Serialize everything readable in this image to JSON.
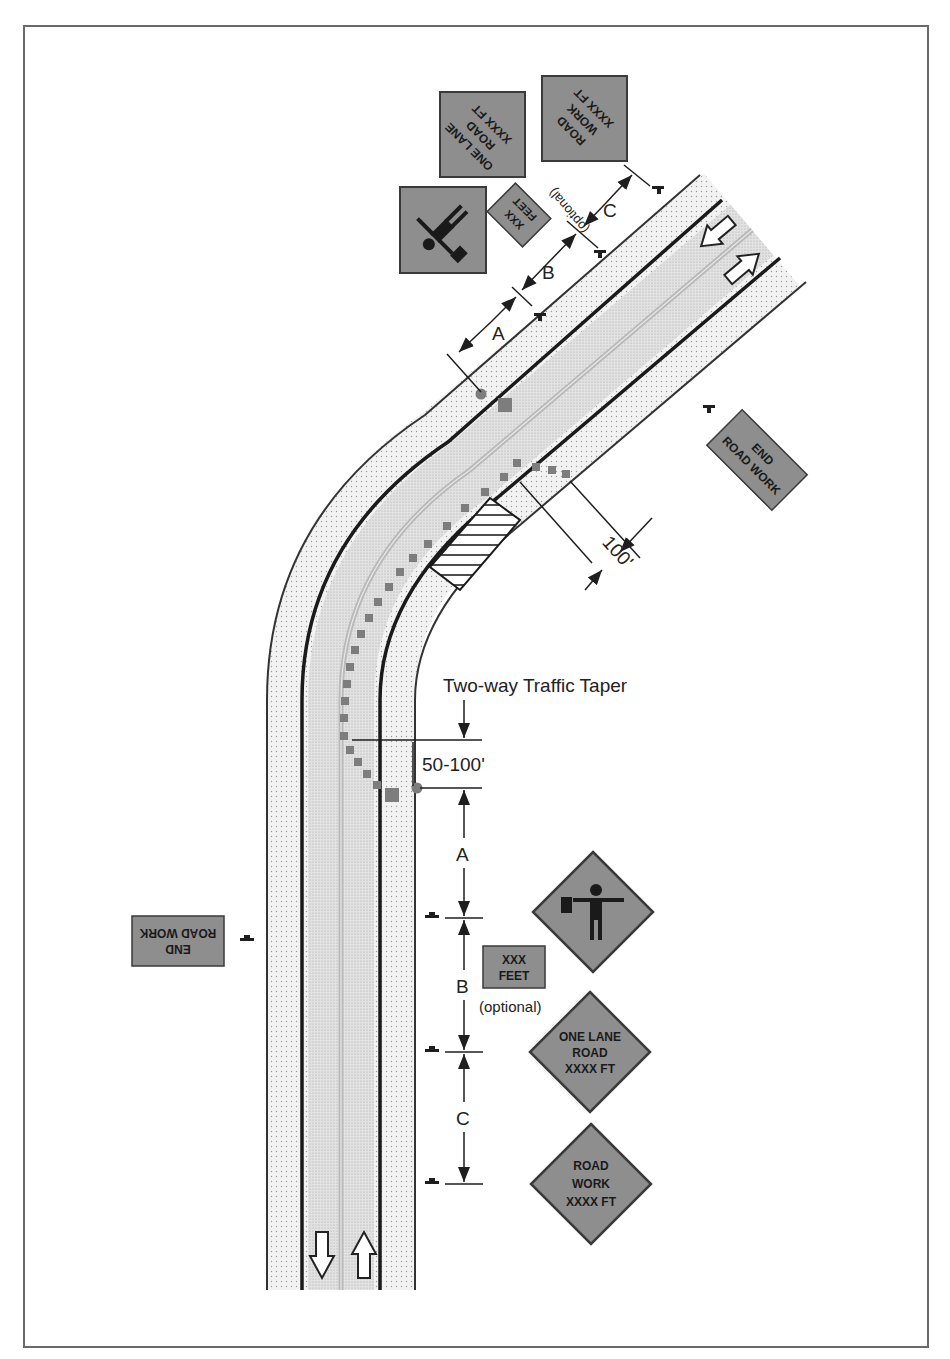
{
  "diagram": {
    "title_annotation": "Two-way Traffic Taper",
    "taper_length": "50-100'",
    "buffer_length": "100'",
    "colors": {
      "sign_fill": "#8e8e8e",
      "sign_border": "#3a3a3a",
      "shoulder_fill": "#ececec",
      "lane_fill": "#dedede",
      "work_area_hatch": "#222222",
      "frame": "#6a6a6a"
    },
    "spacing_labels": {
      "top": {
        "a": "A",
        "b": "B",
        "c": "C",
        "optional": "(optional)"
      },
      "bottom": {
        "a": "A",
        "b": "B",
        "c": "C",
        "optional": "(optional)"
      }
    },
    "signs_top": {
      "road_work": {
        "line1": "ROAD",
        "line2": "WORK",
        "line3": "XXXX FT"
      },
      "one_lane": {
        "line1": "ONE LANE",
        "line2": "ROAD",
        "line3": "XXXX FT"
      },
      "xxx_feet": {
        "line1": "XXX",
        "line2": "FEET"
      },
      "flagger": {
        "icon": "flagger-icon"
      },
      "end_road_work": {
        "line1": "END",
        "line2": "ROAD WORK"
      }
    },
    "signs_bottom": {
      "flagger": {
        "icon": "flagger-icon"
      },
      "xxx_feet": {
        "line1": "XXX",
        "line2": "FEET"
      },
      "one_lane": {
        "line1": "ONE LANE",
        "line2": "ROAD",
        "line3": "XXXX FT"
      },
      "road_work": {
        "line1": "ROAD",
        "line2": "WORK",
        "line3": "XXXX FT"
      },
      "end_road_work": {
        "line1": "END",
        "line2": "ROAD WORK"
      }
    },
    "traffic_arrows": [
      "arrow-down-icon",
      "arrow-up-icon",
      "arrow-down-left-icon",
      "arrow-up-right-icon"
    ]
  }
}
